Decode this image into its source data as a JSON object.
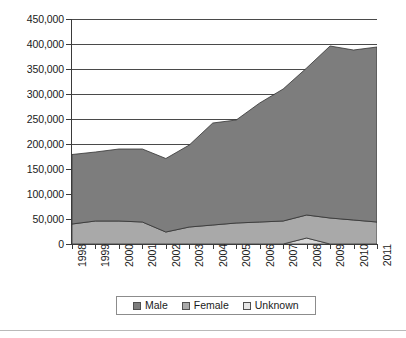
{
  "chart_data": {
    "type": "area",
    "stacked": true,
    "title": "",
    "subtitle": "",
    "xlabel": "",
    "ylabel": "",
    "categories": [
      "1998",
      "1999",
      "2000",
      "2001",
      "2002",
      "2003",
      "2004",
      "2005",
      "2006",
      "2007",
      "2008",
      "2009",
      "2010",
      "2011"
    ],
    "series": [
      {
        "name": "Unknown",
        "color": "#d9d9d9",
        "values": [
          0,
          0,
          0,
          0,
          0,
          0,
          0,
          0,
          0,
          0,
          12000,
          0,
          0,
          0
        ]
      },
      {
        "name": "Female",
        "color": "#a9a9a9",
        "values": [
          40000,
          46000,
          46000,
          44000,
          24000,
          34000,
          38000,
          42000,
          44000,
          46000,
          46000,
          52000,
          48000,
          44000
        ]
      },
      {
        "name": "Male",
        "color": "#7d7d7d",
        "values": [
          139000,
          138000,
          144000,
          146000,
          147000,
          164000,
          204000,
          206000,
          238000,
          264000,
          294000,
          344000,
          340000,
          350000
        ]
      }
    ],
    "totals": [
      179000,
      184000,
      190000,
      190000,
      171000,
      198000,
      242000,
      248000,
      282000,
      310000,
      352000,
      396000,
      388000,
      394000
    ],
    "ylim": [
      0,
      450000
    ],
    "ytick_step": 50000,
    "ytick_labels": [
      "450,000",
      "400,000",
      "350,000",
      "300,000",
      "250,000",
      "200,000",
      "150,000",
      "100,000",
      "50,000",
      "0"
    ],
    "ytick_values": [
      450000,
      400000,
      350000,
      300000,
      250000,
      200000,
      150000,
      100000,
      50000,
      0
    ],
    "grid": true,
    "legend_position": "bottom"
  },
  "legend": {
    "items": [
      {
        "label": "Male",
        "color": "#7d7d7d"
      },
      {
        "label": "Female",
        "color": "#a9a9a9"
      },
      {
        "label": "Unknown",
        "color": "#e6e6e6"
      }
    ]
  }
}
